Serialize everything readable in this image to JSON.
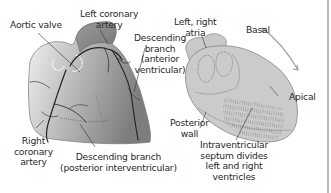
{
  "labels": {
    "aortic_valve": "Aortic valve",
    "left_coronary_artery": [
      "Left coronary",
      "artery"
    ],
    "descending_branch_anterior": [
      "Descending",
      "branch",
      "(anterior",
      "ventricular)"
    ],
    "right_coronary_artery": [
      "Right",
      "coronary",
      "artery"
    ],
    "descending_branch_posterior": [
      "Descending branch",
      "(posterior interventricular)"
    ],
    "atria": [
      "Left, right",
      "atria"
    ],
    "basal": "Basal",
    "apical": "Apical",
    "posterior_wall": [
      "Posterior",
      "wall"
    ],
    "septum": [
      "Intraventricular",
      "septum divides",
      "left and right",
      "ventricles"
    ]
  },
  "colors": {
    "heart_light": "#d6d6d6",
    "heart_dark": "#8a8a8a",
    "vessel": "#222222",
    "arrow": "#9a9a9a"
  }
}
